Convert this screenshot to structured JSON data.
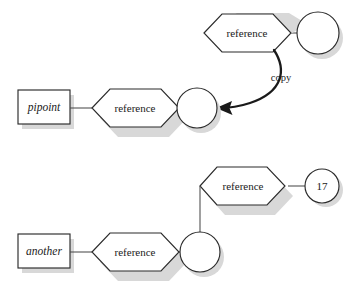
{
  "diagram": {
    "background_color": "#ffffff",
    "stroke_color": "#2b2b2b",
    "shadow_color": "#d8d8d8",
    "connector_color": "#4a4a4a"
  },
  "groups": [
    {
      "id": "top-group",
      "nodes": {
        "variable_box": {
          "label": "pipoint",
          "shape": "rectangle",
          "style": "italic"
        },
        "left_reference": {
          "label": "reference",
          "shape": "hexagon"
        },
        "target_circle": {
          "label": "",
          "shape": "circle"
        },
        "source_reference": {
          "label": "reference",
          "shape": "hexagon"
        },
        "source_circle": {
          "label": "",
          "shape": "circle"
        }
      },
      "edges": {
        "copy_arrow": {
          "label": "copy",
          "style": "curved-arrow"
        }
      }
    },
    {
      "id": "bottom-group",
      "nodes": {
        "variable_box": {
          "label": "another",
          "shape": "rectangle",
          "style": "italic"
        },
        "left_reference": {
          "label": "reference",
          "shape": "hexagon"
        },
        "target_circle": {
          "label": "",
          "shape": "circle"
        },
        "upper_reference": {
          "label": "reference",
          "shape": "hexagon"
        },
        "value_circle": {
          "label": "17",
          "shape": "circle"
        }
      },
      "edges": {
        "vertical_link": {
          "label": "",
          "style": "line"
        }
      }
    }
  ]
}
